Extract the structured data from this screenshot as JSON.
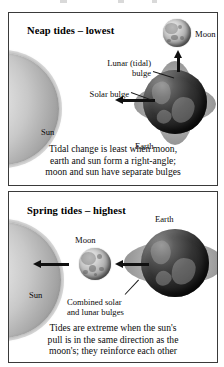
{
  "diagram": {
    "panels": [
      {
        "id": "neap",
        "title": "Neap tides – lowest",
        "bodies": {
          "sun": "Sun",
          "earth": "Earth",
          "moon": "Moon"
        },
        "annotations": {
          "lunar_bulge_line1": "Lunar (tidal)",
          "lunar_bulge_line2": "bulge",
          "solar_bulge": "Solar bulge"
        },
        "caption": [
          "Tidal change is least when moon,",
          "earth and sun form a right-angle;",
          "moon and sun have separate bulges"
        ]
      },
      {
        "id": "spring",
        "title": "Spring tides – highest",
        "bodies": {
          "sun": "Sun",
          "earth": "Earth",
          "moon": "Moon"
        },
        "annotations": {
          "combined_bulge_line1": "Combined solar",
          "combined_bulge_line2": "and lunar bulges"
        },
        "caption": [
          "Tides are extreme when the sun's",
          "pull is in the same direction as the",
          "moon's; they reinforce each other"
        ]
      }
    ],
    "icons": {
      "arrow_left": "arrow-left-icon",
      "arrow_up": "arrow-up-icon",
      "sun": "sun-icon",
      "earth": "earth-icon",
      "moon": "moon-icon"
    },
    "colors": {
      "page_background": "#ffffff",
      "frame_border": "#3a3a3a",
      "text": "#0b0b0b",
      "arrow": "#101010",
      "earth_dark": "#1c1c1c",
      "bulge_grey": "#b4b4b4",
      "sun_grey": "#c8c8c8",
      "moon_grey": "#b6b6b6"
    }
  }
}
